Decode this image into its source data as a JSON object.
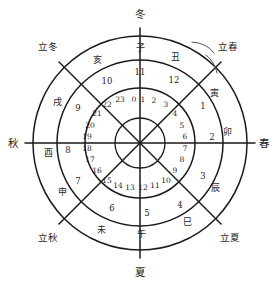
{
  "diagram": {
    "center": {
      "x": 140,
      "y": 143
    },
    "radii": {
      "outer": 107,
      "branch": 83,
      "double_hour": 55,
      "inner": 25
    },
    "stroke_color": "#1a1a1a"
  },
  "seasons": [
    {
      "name": "winter-top",
      "label": "冬",
      "x": 140,
      "y": 14
    },
    {
      "name": "spring-right",
      "label": "春",
      "x": 264,
      "y": 143
    },
    {
      "name": "summer-bottom",
      "label": "夏",
      "x": 140,
      "y": 272
    },
    {
      "name": "autumn-left",
      "label": "秋",
      "x": 13,
      "y": 143
    }
  ],
  "solar_terms": [
    {
      "name": "start-of-spring",
      "label": "立春",
      "x": 228,
      "y": 47
    },
    {
      "name": "start-of-summer",
      "label": "立夏",
      "x": 230,
      "y": 238
    },
    {
      "name": "start-of-autumn",
      "label": "立秋",
      "x": 48,
      "y": 238
    },
    {
      "name": "start-of-winter",
      "label": "立冬",
      "x": 48,
      "y": 47
    }
  ],
  "branches": [
    {
      "label": "子",
      "x": 140,
      "y": 48
    },
    {
      "label": "丑",
      "x": 175,
      "y": 57
    },
    {
      "label": "寅",
      "x": 214,
      "y": 93
    },
    {
      "label": "卯",
      "x": 227,
      "y": 132
    },
    {
      "label": "辰",
      "x": 215,
      "y": 188
    },
    {
      "label": "巳",
      "x": 187,
      "y": 222
    },
    {
      "label": "午",
      "x": 141,
      "y": 234
    },
    {
      "label": "未",
      "x": 101,
      "y": 230
    },
    {
      "label": "申",
      "x": 62,
      "y": 192
    },
    {
      "label": "酉",
      "x": 48,
      "y": 153
    },
    {
      "label": "戌",
      "x": 57,
      "y": 102
    },
    {
      "label": "亥",
      "x": 97,
      "y": 60
    }
  ],
  "double_hours": [
    {
      "label": "12",
      "x": 174,
      "y": 80
    },
    {
      "label": "1",
      "x": 203,
      "y": 106
    },
    {
      "label": "2",
      "x": 212,
      "y": 137
    },
    {
      "label": "3",
      "x": 203,
      "y": 176
    },
    {
      "label": "4",
      "x": 180,
      "y": 205
    },
    {
      "label": "5",
      "x": 147,
      "y": 213
    },
    {
      "label": "6",
      "x": 112,
      "y": 208
    },
    {
      "label": "7",
      "x": 78,
      "y": 181
    },
    {
      "label": "8",
      "x": 68,
      "y": 150
    },
    {
      "label": "9",
      "x": 78,
      "y": 108
    },
    {
      "label": "10",
      "x": 107,
      "y": 81
    },
    {
      "label": "11",
      "x": 140,
      "y": 72
    }
  ],
  "hours": [
    {
      "label": "0",
      "x": 134,
      "y": 100
    },
    {
      "label": "1",
      "x": 143,
      "y": 100
    },
    {
      "label": "2",
      "x": 154,
      "y": 101
    },
    {
      "label": "3",
      "x": 166,
      "y": 105
    },
    {
      "label": "4",
      "x": 175,
      "y": 114
    },
    {
      "label": "5",
      "x": 182,
      "y": 126
    },
    {
      "label": "6",
      "x": 185,
      "y": 137
    },
    {
      "label": "7",
      "x": 185,
      "y": 149
    },
    {
      "label": "8",
      "x": 182,
      "y": 160
    },
    {
      "label": "9",
      "x": 175,
      "y": 171
    },
    {
      "label": "10",
      "x": 166,
      "y": 181
    },
    {
      "label": "11",
      "x": 155,
      "y": 186
    },
    {
      "label": "12",
      "x": 143,
      "y": 188
    },
    {
      "label": "13",
      "x": 130,
      "y": 188
    },
    {
      "label": "14",
      "x": 118,
      "y": 186
    },
    {
      "label": "15",
      "x": 107,
      "y": 181
    },
    {
      "label": "16",
      "x": 97,
      "y": 171
    },
    {
      "label": "17",
      "x": 90,
      "y": 160
    },
    {
      "label": "18",
      "x": 87,
      "y": 149
    },
    {
      "label": "19",
      "x": 87,
      "y": 137
    },
    {
      "label": "20",
      "x": 90,
      "y": 126
    },
    {
      "label": "21",
      "x": 97,
      "y": 114
    },
    {
      "label": "22",
      "x": 107,
      "y": 105
    },
    {
      "label": "23",
      "x": 120,
      "y": 100
    }
  ],
  "annotation": {
    "name": "brace-mark-near-start-of-spring",
    "label": ""
  }
}
